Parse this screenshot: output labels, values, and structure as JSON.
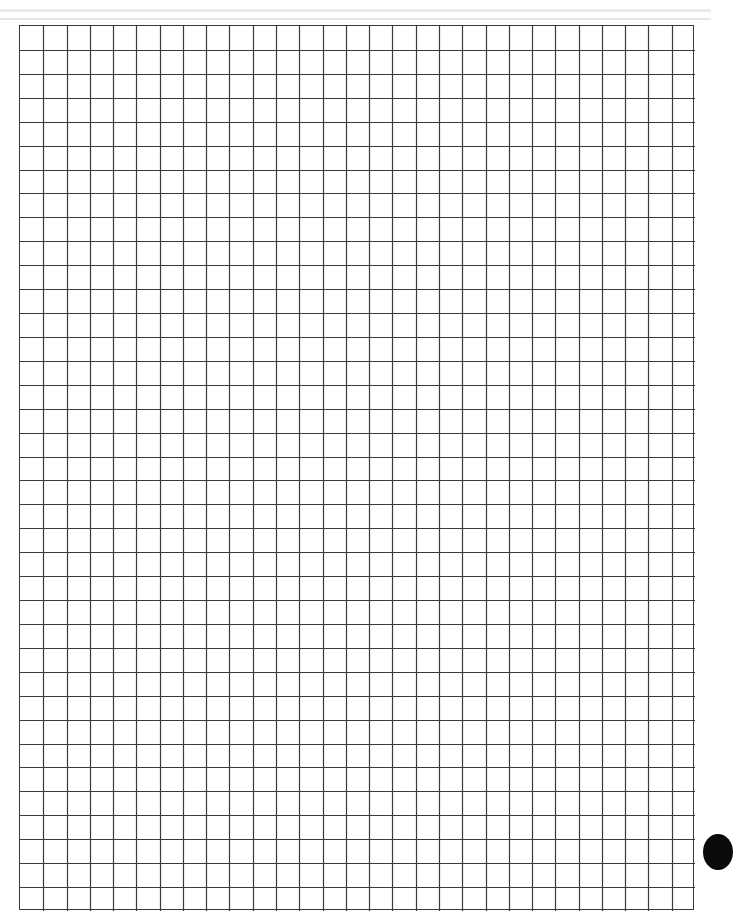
{
  "page": {
    "type": "graph-paper-sheet",
    "background_color": "#ffffff"
  },
  "header_rules": {
    "count": 2,
    "color": "#ebebeb"
  },
  "grid": {
    "columns": 29,
    "rows": 37,
    "line_color": "#3a3a3a",
    "cell_width_px": 23.25,
    "cell_height_px": 23.9
  },
  "edge_mark": {
    "shape": "partial-circle",
    "color": "#0a0a0a"
  }
}
